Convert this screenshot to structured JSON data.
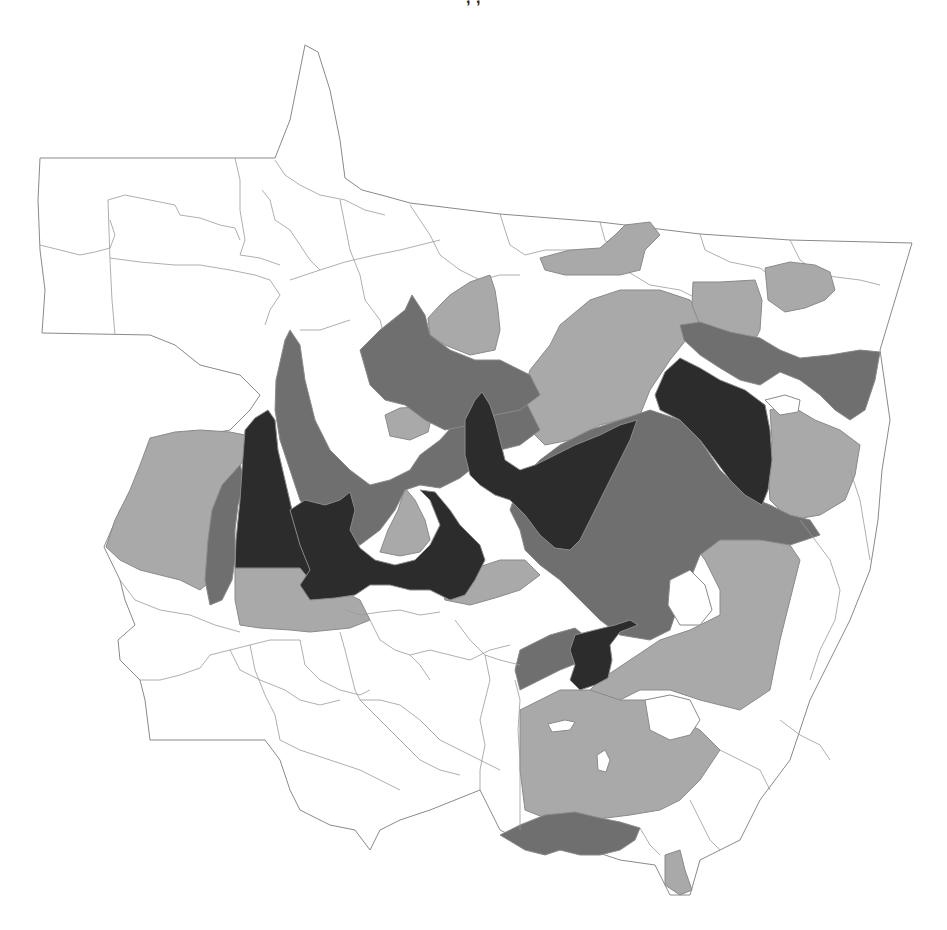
{
  "map": {
    "title_fragment": ", ,",
    "region": "Mato Grosso municipalities",
    "classes": [
      {
        "id": "c0",
        "color": "#ffffff",
        "label": ""
      },
      {
        "id": "c1",
        "color": "#a9a9a9",
        "label": ""
      },
      {
        "id": "c2",
        "color": "#6f6f6f",
        "label": ""
      },
      {
        "id": "c3",
        "color": "#2c2c2c",
        "label": ""
      }
    ],
    "border_color": "#8a8a8a",
    "background": "#ffffff"
  }
}
